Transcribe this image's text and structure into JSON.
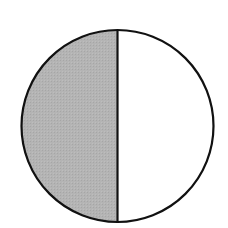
{
  "diagram": {
    "type": "fraction-circle",
    "parts_total": 2,
    "parts_shaded": 1,
    "shaded_side": "left",
    "colors": {
      "background": "#ffffff",
      "stroke": "#111111",
      "shaded_fill": "#b0b0b0",
      "unshaded_fill": "#ffffff"
    }
  }
}
